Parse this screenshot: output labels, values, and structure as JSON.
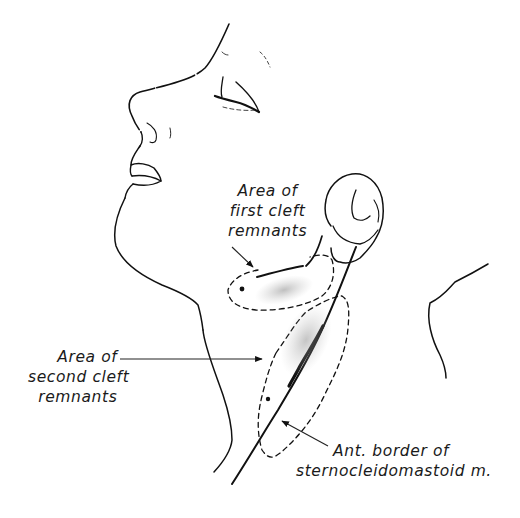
{
  "figure": {
    "colors": {
      "line": "#111111",
      "background": "#ffffff",
      "stipple": "#9a9a9a"
    }
  },
  "labels": {
    "first_cleft": {
      "lines": [
        "Area of",
        "first cleft",
        "remnants"
      ]
    },
    "second_cleft": {
      "lines": [
        "Area of",
        "second cleft",
        "remnants"
      ]
    },
    "scm_border": {
      "lines": [
        "Ant. border of",
        "sternocleidomastoid  m."
      ]
    }
  }
}
